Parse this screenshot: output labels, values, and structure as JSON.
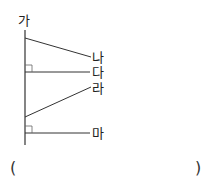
{
  "diagram": {
    "type": "lines-perpendicular-check",
    "main_line_label": "가",
    "lines": [
      {
        "label": "나",
        "relation": "slanted"
      },
      {
        "label": "다",
        "relation": "perpendicular"
      },
      {
        "label": "라",
        "relation": "slanted"
      },
      {
        "label": "마",
        "relation": "perpendicular"
      }
    ]
  },
  "answer": {
    "open_paren": "(",
    "close_paren": ")",
    "value": ""
  }
}
